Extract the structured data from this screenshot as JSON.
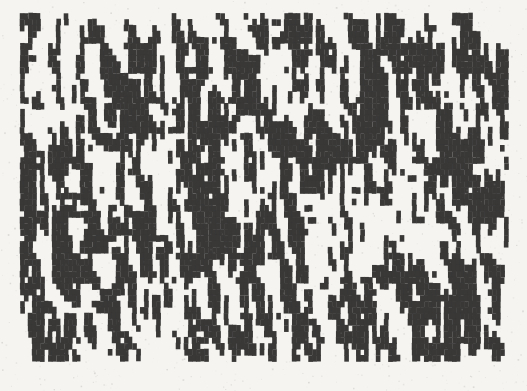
{
  "figure": {
    "type": "scanned-binary-bar-texture",
    "alt": "Dense abstract pattern of random black vertical bars and rectangular blocks on white paper, resembling a scanned halftone noise texture",
    "ink_color": "#3a3938",
    "paper_color": "#f3f2ef"
  },
  "pattern": {
    "seed": 813246,
    "canvas": {
      "width": 527,
      "height": 391
    },
    "area": {
      "x": 20,
      "y": 13,
      "width": 488,
      "height": 348
    },
    "grid": {
      "cols": 122,
      "rows": 58,
      "cell_width": 4,
      "cell_height": 6
    },
    "probabilities": {
      "vertical_persistence": 0.62,
      "vertical_persistence_band_top": 0.4,
      "horizontal_persistence": 0.52,
      "base_black": 0.5,
      "band_rows": 5,
      "band_bottom_boost": 0.18,
      "band_top_penalty": 0.12,
      "boundary_row_scale": 0.65
    },
    "render": {
      "jitter_px": 0.7,
      "overlap_px": 0.6,
      "noise_dots": 2800,
      "noise_alpha": 0.16,
      "noise_max_size": 1.4
    }
  }
}
